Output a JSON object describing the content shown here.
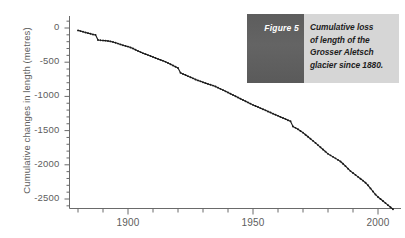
{
  "caption": {
    "tag": "Figure 5",
    "lines": [
      "Cumulative loss",
      "of length of the",
      "Grosser Aletsch",
      "glacier since 1880."
    ],
    "tag_bg": "#5d5d5d",
    "body_bg": "#d6d6d6"
  },
  "chart_data": {
    "type": "line",
    "title": "",
    "xlabel": "",
    "ylabel": "Cumulative changes in length (metres)",
    "xlim": [
      1878,
      2008
    ],
    "ylim": [
      -2750,
      120
    ],
    "grid": false,
    "legend": "none",
    "x_major_ticks": [
      1900,
      1950,
      2000
    ],
    "x_tick_labels": [
      "1900",
      "1950",
      "2000"
    ],
    "x_minor_step": 10,
    "y_major_ticks": [
      0,
      -500,
      -1000,
      -1500,
      -2000,
      -2500
    ],
    "y_tick_labels": [
      "0",
      "-500",
      "-1000",
      "-1500",
      "-2000",
      "-2500"
    ],
    "y_minor_step": 100,
    "marker": "dot",
    "line_color": "#1a1a1a",
    "axis_color": "#6a6a6a",
    "series": [
      {
        "name": "Grosser Aletsch cumulative length change",
        "units": "metres",
        "x": [
          1880,
          1881,
          1882,
          1883,
          1884,
          1885,
          1886,
          1887,
          1888,
          1889,
          1890,
          1891,
          1892,
          1893,
          1894,
          1895,
          1896,
          1897,
          1898,
          1899,
          1900,
          1901,
          1902,
          1903,
          1904,
          1905,
          1906,
          1907,
          1908,
          1909,
          1910,
          1911,
          1912,
          1913,
          1914,
          1915,
          1916,
          1917,
          1918,
          1919,
          1920,
          1921,
          1922,
          1923,
          1924,
          1925,
          1926,
          1927,
          1928,
          1929,
          1930,
          1931,
          1932,
          1933,
          1934,
          1935,
          1936,
          1937,
          1938,
          1939,
          1940,
          1941,
          1942,
          1943,
          1944,
          1945,
          1946,
          1947,
          1948,
          1949,
          1950,
          1951,
          1952,
          1953,
          1954,
          1955,
          1956,
          1957,
          1958,
          1959,
          1960,
          1961,
          1962,
          1963,
          1964,
          1965,
          1966,
          1967,
          1968,
          1969,
          1970,
          1971,
          1972,
          1973,
          1974,
          1975,
          1976,
          1977,
          1978,
          1979,
          1980,
          1981,
          1982,
          1983,
          1984,
          1985,
          1986,
          1987,
          1988,
          1989,
          1990,
          1991,
          1992,
          1993,
          1994,
          1995,
          1996,
          1997,
          1998,
          1999,
          2000,
          2001,
          2002,
          2003,
          2004,
          2005,
          2006
        ],
        "y": [
          -35,
          -45,
          -55,
          -65,
          -75,
          -85,
          -95,
          -100,
          -175,
          -180,
          -182,
          -185,
          -190,
          -196,
          -205,
          -215,
          -228,
          -240,
          -252,
          -262,
          -272,
          -285,
          -300,
          -318,
          -335,
          -352,
          -368,
          -382,
          -396,
          -410,
          -424,
          -438,
          -452,
          -466,
          -480,
          -495,
          -512,
          -530,
          -548,
          -566,
          -585,
          -655,
          -672,
          -688,
          -704,
          -720,
          -736,
          -752,
          -766,
          -780,
          -794,
          -806,
          -818,
          -830,
          -842,
          -856,
          -872,
          -890,
          -908,
          -926,
          -944,
          -962,
          -980,
          -998,
          -1016,
          -1034,
          -1052,
          -1070,
          -1088,
          -1106,
          -1124,
          -1140,
          -1156,
          -1172,
          -1188,
          -1204,
          -1220,
          -1236,
          -1252,
          -1268,
          -1284,
          -1300,
          -1316,
          -1332,
          -1348,
          -1364,
          -1440,
          -1460,
          -1480,
          -1505,
          -1530,
          -1560,
          -1590,
          -1620,
          -1650,
          -1680,
          -1712,
          -1744,
          -1776,
          -1808,
          -1840,
          -1862,
          -1884,
          -1906,
          -1928,
          -1952,
          -1985,
          -2020,
          -2056,
          -2092,
          -2120,
          -2148,
          -2176,
          -2204,
          -2232,
          -2262,
          -2300,
          -2345,
          -2390,
          -2435,
          -2470,
          -2500,
          -2530,
          -2560,
          -2590,
          -2620,
          -2650
        ]
      }
    ]
  }
}
